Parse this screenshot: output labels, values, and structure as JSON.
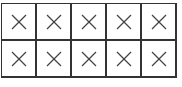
{
  "board": {
    "rows": 2,
    "cols": 5,
    "cells": [
      [
        "x",
        "x",
        "x",
        "x",
        "x"
      ],
      [
        "x",
        "x",
        "x",
        "x",
        "x"
      ]
    ],
    "mark_icon": "cross-icon",
    "line_color": "#333333",
    "mark_color": "#444444"
  }
}
